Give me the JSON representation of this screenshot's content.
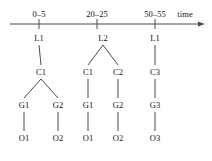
{
  "diagram": {
    "type": "timeline-hierarchy-tree",
    "axis": {
      "name": "time-axis",
      "label": "time",
      "ticks": [
        {
          "label": "0–5",
          "x": 39
        },
        {
          "label": "20–25",
          "x": 97
        },
        {
          "label": "50–55",
          "x": 155
        }
      ],
      "arrow": "right"
    },
    "levels": [
      "L",
      "C",
      "G",
      "O"
    ],
    "nodes": [
      {
        "id": "n1",
        "label": "L1",
        "level": 0,
        "x": 39,
        "y": 38
      },
      {
        "id": "n2",
        "label": "L2",
        "level": 0,
        "x": 103,
        "y": 38
      },
      {
        "id": "n3",
        "label": "L1",
        "level": 0,
        "x": 155,
        "y": 38
      },
      {
        "id": "n4",
        "label": "C1",
        "level": 1,
        "x": 41,
        "y": 72
      },
      {
        "id": "n5",
        "label": "C1",
        "level": 1,
        "x": 88,
        "y": 72
      },
      {
        "id": "n6",
        "label": "C2",
        "level": 1,
        "x": 118,
        "y": 72
      },
      {
        "id": "n7",
        "label": "C3",
        "level": 1,
        "x": 155,
        "y": 72
      },
      {
        "id": "n8",
        "label": "G1",
        "level": 2,
        "x": 24,
        "y": 105
      },
      {
        "id": "n9",
        "label": "G2",
        "level": 2,
        "x": 58,
        "y": 105
      },
      {
        "id": "n10",
        "label": "G1",
        "level": 2,
        "x": 88,
        "y": 105
      },
      {
        "id": "n11",
        "label": "G2",
        "level": 2,
        "x": 118,
        "y": 105
      },
      {
        "id": "n12",
        "label": "G3",
        "level": 2,
        "x": 155,
        "y": 105
      },
      {
        "id": "n13",
        "label": "O1",
        "level": 3,
        "x": 24,
        "y": 138
      },
      {
        "id": "n14",
        "label": "O2",
        "level": 3,
        "x": 58,
        "y": 138
      },
      {
        "id": "n15",
        "label": "O1",
        "level": 3,
        "x": 88,
        "y": 138
      },
      {
        "id": "n16",
        "label": "O2",
        "level": 3,
        "x": 118,
        "y": 138
      },
      {
        "id": "n17",
        "label": "O3",
        "level": 3,
        "x": 155,
        "y": 138
      }
    ],
    "edges": [
      {
        "from": "n1",
        "to": "n4"
      },
      {
        "from": "n2",
        "to": "n5"
      },
      {
        "from": "n2",
        "to": "n6"
      },
      {
        "from": "n3",
        "to": "n7"
      },
      {
        "from": "n4",
        "to": "n8"
      },
      {
        "from": "n4",
        "to": "n9"
      },
      {
        "from": "n5",
        "to": "n10"
      },
      {
        "from": "n6",
        "to": "n11"
      },
      {
        "from": "n7",
        "to": "n12"
      },
      {
        "from": "n8",
        "to": "n13"
      },
      {
        "from": "n9",
        "to": "n14"
      },
      {
        "from": "n10",
        "to": "n15"
      },
      {
        "from": "n11",
        "to": "n16"
      },
      {
        "from": "n12",
        "to": "n17"
      }
    ],
    "colors": {
      "background": "#ffffff",
      "line": "#4a4a4a",
      "text": "#141414"
    },
    "geometry": {
      "axis_y": 24,
      "axis_x_start": 10,
      "axis_x_end": 199,
      "tick_half_height": 5,
      "time_label_x": 185,
      "time_label_y": 14,
      "node_gap": 7
    }
  }
}
